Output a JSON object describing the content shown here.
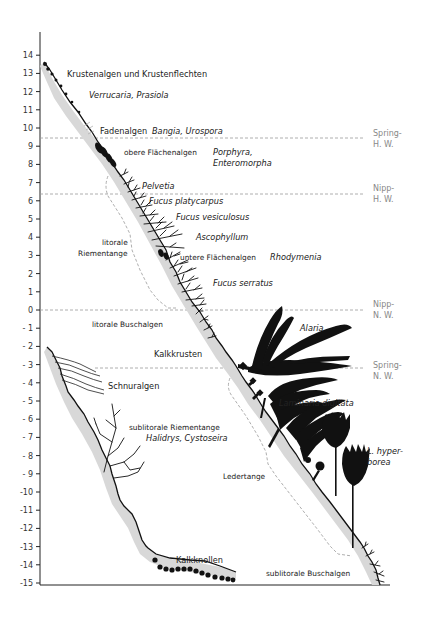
{
  "figure": {
    "type": "algae-zonation-profile",
    "y_axis": {
      "min": -15,
      "max": 14,
      "ticks": [
        14,
        13,
        12,
        11,
        10,
        9,
        8,
        7,
        6,
        5,
        4,
        3,
        2,
        1,
        0,
        -1,
        -2,
        -3,
        -4,
        -5,
        -6,
        -7,
        -8,
        -9,
        -10,
        -11,
        -12,
        -13,
        -14,
        -15
      ],
      "tick_labels": [
        "14",
        "13",
        "12",
        "11",
        "10",
        "9",
        "8",
        "7",
        "6",
        "5",
        "4",
        "3",
        "2",
        "1",
        "0",
        "- 1",
        "- 2",
        "- 3",
        "- 4",
        "- 5",
        "- 6",
        "- 7",
        "- 8",
        "- 9",
        "-10",
        "-11",
        "-12",
        "-13",
        "-14",
        "-15"
      ]
    },
    "tide_levels": [
      {
        "label_line1": "Spring-",
        "label_line2": "H. W.",
        "level": 9.4
      },
      {
        "label_line1": "Nipp-",
        "label_line2": "H. W.",
        "level": 6.3
      },
      {
        "label_line1": "Nipp-",
        "label_line2": "N. W.",
        "level": 0
      },
      {
        "label_line1": "Spring-",
        "label_line2": "N. W.",
        "level": -3.2
      }
    ],
    "labels": {
      "krustenalgen": "Krustenalgen und Krustenflechten",
      "verrucaria": "Verrucaria, Prasiola",
      "fadenalgen": "Fadenalgen",
      "bangia": "Bangia, Urospora",
      "obere_flaechenalgen": "obere Flächenalgen",
      "porphyra": "Porphyra,",
      "enteromorpha": "Enteromorpha",
      "pelvetia": "Pelvetia",
      "fucus_platycarpus": "Fucus platycarpus",
      "fucus_vesiculosus": "Fucus vesiculosus",
      "ascophyllum": "Ascophyllum",
      "untere_flaechenalgen": "untere Flächenalgen",
      "rhodymenia": "Rhodymenia",
      "fucus_serratus": "Fucus serratus",
      "litorale_riementange_1": "litorale",
      "litorale_riementange_2": "Riementange",
      "litorale_buschalgen": "litorale Buschalgen",
      "alaria": "Alaria",
      "kalkkrusten": "Kalkkrusten",
      "schnuralgen": "Schnuralgen",
      "laminaria_digitata": "Laminaria digitata",
      "sublitorale_riementange": "sublitorale Riementange",
      "halidrys": "Halidrys, Cystoseira",
      "l_hyper": "L. hyper-",
      "borea": "borea",
      "ledertange": "Ledertange",
      "kalkknollen": "Kalkknollen",
      "sublitorale_buschalgen": "sublitorale Buschalgen"
    }
  }
}
